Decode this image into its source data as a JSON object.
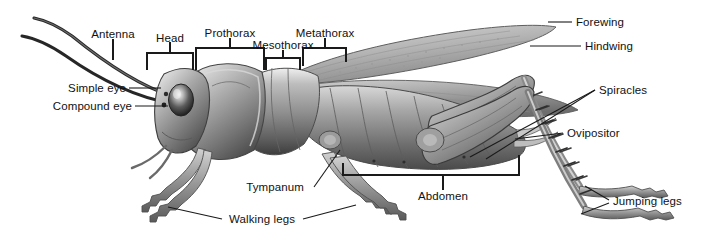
{
  "figure": {
    "view": "lateral",
    "background_color": "#ffffff",
    "label_color": "#111111",
    "leader_color": "#1a1a1a",
    "width": 711,
    "height": 243
  },
  "labels": {
    "antenna": "Antenna",
    "head": "Head",
    "prothorax": "Prothorax",
    "mesothorax": "Mesothorax",
    "metathorax": "Metathorax",
    "forewing": "Forewing",
    "hindwing": "Hindwing",
    "simple_eye": "Simple eye",
    "compound_eye": "Compound eye",
    "spiracles": "Spiracles",
    "ovipositor": "Ovipositor",
    "abdomen": "Abdomen",
    "jumping_legs": "Jumping legs",
    "walking_legs": "Walking legs",
    "tympanum": "Tympanum"
  },
  "annotations": [
    {
      "name": "antenna",
      "text": "Antenna",
      "x": 113,
      "y": 34,
      "align": "c",
      "connector": "stem-down"
    },
    {
      "name": "head",
      "text": "Head",
      "x": 170,
      "y": 48,
      "align": "c",
      "connector": "bracket-down"
    },
    {
      "name": "prothorax",
      "text": "Prothorax",
      "x": 230,
      "y": 33,
      "align": "c",
      "connector": "bracket-down"
    },
    {
      "name": "mesothorax",
      "text": "Mesothorax",
      "x": 283,
      "y": 45,
      "align": "c",
      "connector": "bracket-down"
    },
    {
      "name": "metathorax",
      "text": "Metathorax",
      "x": 325,
      "y": 33,
      "align": "c",
      "connector": "bracket-down"
    },
    {
      "name": "forewing",
      "text": "Forewing",
      "x": 574,
      "y": 20,
      "align": "l",
      "connector": "line-left"
    },
    {
      "name": "hindwing",
      "text": "Hindwing",
      "x": 583,
      "y": 44,
      "align": "l",
      "connector": "line-left"
    },
    {
      "name": "simple-eye",
      "text": "Simple eye",
      "x": 126,
      "y": 92,
      "align": "r",
      "connector": "line-right"
    },
    {
      "name": "compound-eye",
      "text": "Compound eye",
      "x": 132,
      "y": 110,
      "align": "r",
      "connector": "line-right"
    },
    {
      "name": "spiracles",
      "text": "Spiracles",
      "x": 597,
      "y": 91,
      "align": "l",
      "connector": "double-line-left"
    },
    {
      "name": "ovipositor",
      "text": "Ovipositor",
      "x": 566,
      "y": 136,
      "align": "l",
      "connector": "line-left"
    },
    {
      "name": "abdomen",
      "text": "Abdomen",
      "x": 443,
      "y": 198,
      "align": "c",
      "connector": "bracket-up"
    },
    {
      "name": "jumping-legs",
      "text": "Jumping legs",
      "x": 611,
      "y": 203,
      "align": "l",
      "connector": "fork-left"
    },
    {
      "name": "walking-legs",
      "text": "Walking legs",
      "x": 262,
      "y": 222,
      "align": "c",
      "connector": "fork-both"
    },
    {
      "name": "tympanum",
      "text": "Tympanum",
      "x": 275,
      "y": 190,
      "align": "c",
      "connector": "line-up-right"
    }
  ]
}
